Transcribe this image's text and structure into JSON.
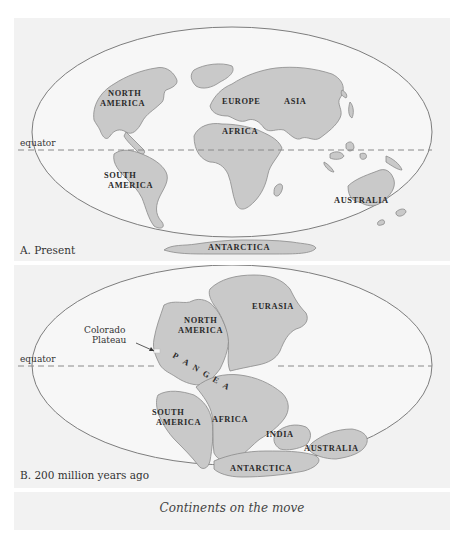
{
  "figure": {
    "caption": "Continents on the move",
    "colors": {
      "land": "#c9c9c9",
      "ocean": "#f7f7f7",
      "panel_bg": "#f2f2f2",
      "outline": "#7d7d7d"
    }
  },
  "panel_a": {
    "label": "A. Present",
    "equator_label": "equator",
    "continents": {
      "north_america": [
        "NORTH",
        "AMERICA"
      ],
      "south_america": [
        "SOUTH",
        "AMERICA"
      ],
      "europe": "EUROPE",
      "asia": "ASIA",
      "africa": "AFRICA",
      "australia": "AUSTRALIA",
      "antarctica": "ANTARCTICA"
    }
  },
  "panel_b": {
    "label": "B. 200 million years ago",
    "equator_label": "equator",
    "annotation": [
      "Colorado",
      "Plateau"
    ],
    "supercontinent": [
      "P",
      "A",
      "N",
      "G",
      "E",
      "A"
    ],
    "continents": {
      "north_america": [
        "NORTH",
        "AMERICA"
      ],
      "eurasia": "EURASIA",
      "south_america": [
        "SOUTH",
        "AMERICA"
      ],
      "africa": "AFRICA",
      "india": "INDIA",
      "australia": "AUSTRALIA",
      "antarctica": "ANTARCTICA"
    }
  }
}
